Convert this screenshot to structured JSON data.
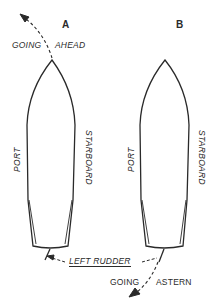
{
  "figure": {
    "boats": [
      {
        "id": "A",
        "label": "A",
        "port_label": "PORT",
        "starboard_label": "STARBOARD",
        "motion": {
          "text_left": "GOING",
          "text_right": "AHEAD",
          "direction": "ahead"
        }
      },
      {
        "id": "B",
        "label": "B",
        "port_label": "PORT",
        "starboard_label": "STARBOARD",
        "motion": {
          "text_left": "GOING",
          "text_right": "ASTERN",
          "direction": "astern"
        }
      }
    ],
    "rudder_label": "LEFT RUDDER",
    "colors": {
      "line": "#2a2a2a",
      "background": "#ffffff"
    }
  }
}
